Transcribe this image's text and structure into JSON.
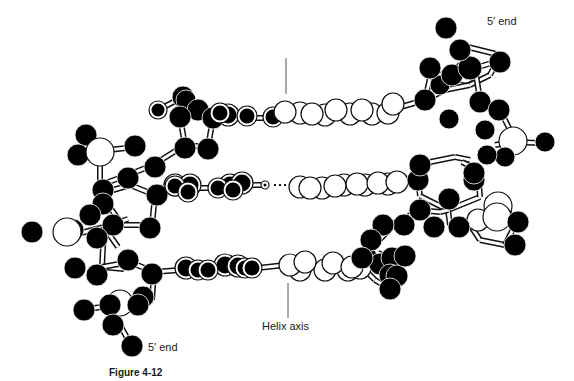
{
  "figure": {
    "caption": "Figure 4-12",
    "labels": {
      "five_prime_top": "5′ end",
      "five_prime_bottom": "5′ end",
      "helix_axis": "Helix axis"
    },
    "colors": {
      "dark_atom": "#000000",
      "light_atom": "#ffffff",
      "stroke": "#111111",
      "axis_line": "#555555"
    },
    "helix_axis_lines": [
      {
        "x1": 286,
        "y1": 58,
        "x2": 286,
        "y2": 94
      },
      {
        "x1": 288,
        "y1": 283,
        "x2": 288,
        "y2": 318
      }
    ],
    "hbond": {
      "x1": 274,
      "y1": 185,
      "x2": 290,
      "y2": 185
    },
    "bonds": [
      [
        158,
        110,
        183,
        97
      ],
      [
        183,
        97,
        189,
        100
      ],
      [
        183,
        97,
        180,
        117
      ],
      [
        180,
        117,
        185,
        145
      ],
      [
        185,
        145,
        208,
        147
      ],
      [
        208,
        147,
        213,
        118
      ],
      [
        213,
        118,
        198,
        110
      ],
      [
        213,
        118,
        235,
        118
      ],
      [
        235,
        118,
        260,
        118
      ],
      [
        260,
        118,
        275,
        118
      ],
      [
        275,
        118,
        285,
        115
      ],
      [
        285,
        115,
        300,
        115
      ],
      [
        300,
        115,
        325,
        113
      ],
      [
        325,
        113,
        350,
        112
      ],
      [
        350,
        112,
        372,
        112
      ],
      [
        372,
        112,
        390,
        110
      ],
      [
        390,
        110,
        425,
        100
      ],
      [
        425,
        100,
        445,
        90
      ],
      [
        445,
        90,
        470,
        85
      ],
      [
        470,
        85,
        490,
        75
      ],
      [
        490,
        75,
        500,
        55
      ],
      [
        500,
        55,
        460,
        45
      ],
      [
        425,
        100,
        430,
        78
      ],
      [
        430,
        78,
        455,
        70
      ],
      [
        455,
        70,
        465,
        68
      ],
      [
        475,
        68,
        495,
        62
      ],
      [
        475,
        68,
        480,
        100
      ],
      [
        480,
        100,
        500,
        110
      ],
      [
        500,
        110,
        510,
        130
      ],
      [
        510,
        130,
        512,
        142
      ],
      [
        512,
        142,
        540,
        143
      ],
      [
        512,
        142,
        495,
        145
      ],
      [
        512,
        142,
        505,
        155
      ],
      [
        100,
        151,
        135,
        147
      ],
      [
        100,
        151,
        86,
        135
      ],
      [
        100,
        151,
        78,
        158
      ],
      [
        100,
        151,
        100,
        185
      ],
      [
        100,
        185,
        128,
        175
      ],
      [
        128,
        175,
        153,
        165
      ],
      [
        153,
        165,
        185,
        145
      ],
      [
        100,
        185,
        103,
        193
      ],
      [
        103,
        193,
        130,
        185
      ],
      [
        130,
        185,
        155,
        195
      ],
      [
        155,
        195,
        152,
        225
      ],
      [
        152,
        225,
        122,
        225
      ],
      [
        122,
        225,
        105,
        200
      ],
      [
        105,
        200,
        103,
        193
      ],
      [
        155,
        195,
        172,
        188
      ],
      [
        172,
        188,
        215,
        188
      ],
      [
        215,
        188,
        255,
        185
      ],
      [
        255,
        185,
        268,
        185
      ],
      [
        290,
        185,
        320,
        185
      ],
      [
        320,
        185,
        345,
        183
      ],
      [
        345,
        183,
        380,
        182
      ],
      [
        380,
        182,
        418,
        180
      ],
      [
        418,
        180,
        430,
        162
      ],
      [
        430,
        162,
        455,
        157
      ],
      [
        455,
        157,
        470,
        160
      ],
      [
        418,
        180,
        420,
        196
      ],
      [
        420,
        196,
        448,
        210
      ],
      [
        448,
        210,
        480,
        197
      ],
      [
        480,
        197,
        478,
        170
      ],
      [
        478,
        170,
        462,
        162
      ],
      [
        448,
        210,
        450,
        225
      ],
      [
        450,
        225,
        470,
        225
      ],
      [
        470,
        225,
        480,
        240
      ],
      [
        480,
        240,
        505,
        245
      ],
      [
        505,
        245,
        515,
        225
      ],
      [
        515,
        225,
        505,
        205
      ],
      [
        505,
        205,
        485,
        200
      ],
      [
        448,
        210,
        440,
        212
      ],
      [
        440,
        212,
        418,
        210
      ],
      [
        418,
        210,
        400,
        222
      ],
      [
        400,
        222,
        378,
        225
      ],
      [
        378,
        225,
        370,
        240
      ],
      [
        73,
        235,
        104,
        227
      ],
      [
        104,
        227,
        128,
        219
      ],
      [
        104,
        227,
        102,
        267
      ],
      [
        102,
        267,
        124,
        269
      ],
      [
        104,
        227,
        118,
        247
      ],
      [
        102,
        267,
        130,
        262
      ],
      [
        130,
        262,
        154,
        272
      ],
      [
        154,
        272,
        152,
        300
      ],
      [
        152,
        300,
        125,
        308
      ],
      [
        125,
        308,
        112,
        300
      ],
      [
        154,
        272,
        180,
        270
      ],
      [
        180,
        270,
        215,
        270
      ],
      [
        215,
        270,
        258,
        268
      ],
      [
        258,
        268,
        285,
        265
      ],
      [
        285,
        265,
        320,
        265
      ],
      [
        320,
        265,
        340,
        265
      ],
      [
        340,
        265,
        360,
        265
      ],
      [
        360,
        265,
        366,
        255
      ],
      [
        366,
        255,
        394,
        224
      ],
      [
        394,
        224,
        400,
        225
      ],
      [
        360,
        265,
        375,
        280
      ],
      [
        375,
        280,
        388,
        288
      ],
      [
        388,
        288,
        395,
        260
      ],
      [
        395,
        260,
        378,
        253
      ],
      [
        113,
        305,
        120,
        325
      ],
      [
        120,
        325,
        131,
        345
      ],
      [
        113,
        305,
        83,
        310
      ],
      [
        113,
        305,
        130,
        300
      ]
    ],
    "atoms_back": [
      {
        "x": 183,
        "y": 97,
        "r": 11,
        "fill": "dark"
      },
      {
        "x": 300,
        "y": 113,
        "r": 11,
        "fill": "light"
      },
      {
        "x": 325,
        "y": 115,
        "r": 11,
        "fill": "light"
      },
      {
        "x": 350,
        "y": 114,
        "r": 11,
        "fill": "light"
      },
      {
        "x": 372,
        "y": 114,
        "r": 11,
        "fill": "light"
      },
      {
        "x": 388,
        "y": 113,
        "r": 11,
        "fill": "light"
      },
      {
        "x": 300,
        "y": 187,
        "r": 11,
        "fill": "light"
      },
      {
        "x": 322,
        "y": 188,
        "r": 11,
        "fill": "light"
      },
      {
        "x": 344,
        "y": 185,
        "r": 11,
        "fill": "light"
      },
      {
        "x": 365,
        "y": 185,
        "r": 11,
        "fill": "light"
      },
      {
        "x": 388,
        "y": 184,
        "r": 11,
        "fill": "light"
      },
      {
        "x": 300,
        "y": 270,
        "r": 11,
        "fill": "light"
      },
      {
        "x": 325,
        "y": 270,
        "r": 11,
        "fill": "light"
      },
      {
        "x": 348,
        "y": 270,
        "r": 11,
        "fill": "light"
      },
      {
        "x": 360,
        "y": 268,
        "r": 11,
        "fill": "light"
      },
      {
        "x": 228,
        "y": 115,
        "r": 11,
        "fill": "darkring"
      },
      {
        "x": 175,
        "y": 185,
        "r": 11,
        "fill": "darkring"
      },
      {
        "x": 190,
        "y": 185,
        "r": 11,
        "fill": "darkring"
      },
      {
        "x": 230,
        "y": 185,
        "r": 11,
        "fill": "darkring"
      },
      {
        "x": 242,
        "y": 183,
        "r": 11,
        "fill": "darkring"
      },
      {
        "x": 186,
        "y": 268,
        "r": 11,
        "fill": "darkring"
      },
      {
        "x": 225,
        "y": 265,
        "r": 11,
        "fill": "darkring"
      },
      {
        "x": 238,
        "y": 266,
        "r": 11,
        "fill": "darkring"
      }
    ],
    "atoms": [
      {
        "x": 158,
        "y": 110,
        "r": 9,
        "fill": "darkring"
      },
      {
        "x": 186,
        "y": 100,
        "r": 10,
        "fill": "dark"
      },
      {
        "x": 198,
        "y": 110,
        "r": 11,
        "fill": "dark"
      },
      {
        "x": 180,
        "y": 117,
        "r": 11,
        "fill": "dark"
      },
      {
        "x": 213,
        "y": 118,
        "r": 11,
        "fill": "dark"
      },
      {
        "x": 185,
        "y": 148,
        "r": 11,
        "fill": "dark"
      },
      {
        "x": 208,
        "y": 149,
        "r": 11,
        "fill": "dark"
      },
      {
        "x": 220,
        "y": 113,
        "r": 10,
        "fill": "darkring"
      },
      {
        "x": 247,
        "y": 116,
        "r": 10,
        "fill": "darkring"
      },
      {
        "x": 273,
        "y": 117,
        "r": 10,
        "fill": "darkring"
      },
      {
        "x": 285,
        "y": 112,
        "r": 11,
        "fill": "light"
      },
      {
        "x": 312,
        "y": 114,
        "r": 11,
        "fill": "light"
      },
      {
        "x": 336,
        "y": 110,
        "r": 11,
        "fill": "light"
      },
      {
        "x": 362,
        "y": 110,
        "r": 11,
        "fill": "light"
      },
      {
        "x": 393,
        "y": 104,
        "r": 11,
        "fill": "light"
      },
      {
        "x": 425,
        "y": 100,
        "r": 11,
        "fill": "dark"
      },
      {
        "x": 449,
        "y": 119,
        "r": 10,
        "fill": "dark"
      },
      {
        "x": 480,
        "y": 102,
        "r": 11,
        "fill": "dark"
      },
      {
        "x": 440,
        "y": 85,
        "r": 10,
        "fill": "dark"
      },
      {
        "x": 430,
        "y": 68,
        "r": 11,
        "fill": "dark"
      },
      {
        "x": 465,
        "y": 72,
        "r": 11,
        "fill": "light"
      },
      {
        "x": 452,
        "y": 75,
        "r": 11,
        "fill": "dark"
      },
      {
        "x": 470,
        "y": 68,
        "r": 12,
        "fill": "dark"
      },
      {
        "x": 460,
        "y": 50,
        "r": 11,
        "fill": "dark"
      },
      {
        "x": 500,
        "y": 62,
        "r": 11,
        "fill": "dark"
      },
      {
        "x": 446,
        "y": 28,
        "r": 11,
        "fill": "dark"
      },
      {
        "x": 499,
        "y": 110,
        "r": 11,
        "fill": "dark"
      },
      {
        "x": 513,
        "y": 141,
        "r": 14,
        "fill": "light"
      },
      {
        "x": 545,
        "y": 142,
        "r": 10,
        "fill": "dark"
      },
      {
        "x": 505,
        "y": 157,
        "r": 10,
        "fill": "dark"
      },
      {
        "x": 485,
        "y": 130,
        "r": 10,
        "fill": "dark"
      },
      {
        "x": 487,
        "y": 155,
        "r": 10,
        "fill": "dark"
      },
      {
        "x": 86,
        "y": 135,
        "r": 11,
        "fill": "dark"
      },
      {
        "x": 78,
        "y": 155,
        "r": 11,
        "fill": "dark"
      },
      {
        "x": 100,
        "y": 152,
        "r": 14,
        "fill": "light"
      },
      {
        "x": 135,
        "y": 146,
        "r": 11,
        "fill": "dark"
      },
      {
        "x": 155,
        "y": 167,
        "r": 11,
        "fill": "dark"
      },
      {
        "x": 103,
        "y": 190,
        "r": 11,
        "fill": "dark"
      },
      {
        "x": 128,
        "y": 178,
        "r": 11,
        "fill": "dark"
      },
      {
        "x": 103,
        "y": 204,
        "r": 11,
        "fill": "dark"
      },
      {
        "x": 157,
        "y": 195,
        "r": 11,
        "fill": "dark"
      },
      {
        "x": 113,
        "y": 225,
        "r": 11,
        "fill": "dark"
      },
      {
        "x": 150,
        "y": 228,
        "r": 11,
        "fill": "dark"
      },
      {
        "x": 175,
        "y": 186,
        "r": 10,
        "fill": "darkring"
      },
      {
        "x": 188,
        "y": 192,
        "r": 10,
        "fill": "darkring"
      },
      {
        "x": 218,
        "y": 188,
        "r": 10,
        "fill": "darkring"
      },
      {
        "x": 233,
        "y": 190,
        "r": 10,
        "fill": "darkring"
      },
      {
        "x": 265,
        "y": 185,
        "r": 4,
        "fill": "darkring"
      },
      {
        "x": 310,
        "y": 188,
        "r": 11,
        "fill": "light"
      },
      {
        "x": 335,
        "y": 186,
        "r": 11,
        "fill": "light"
      },
      {
        "x": 357,
        "y": 184,
        "r": 11,
        "fill": "light"
      },
      {
        "x": 378,
        "y": 183,
        "r": 11,
        "fill": "light"
      },
      {
        "x": 397,
        "y": 182,
        "r": 11,
        "fill": "light"
      },
      {
        "x": 418,
        "y": 180,
        "r": 11,
        "fill": "dark"
      },
      {
        "x": 449,
        "y": 199,
        "r": 11,
        "fill": "dark"
      },
      {
        "x": 474,
        "y": 180,
        "r": 11,
        "fill": "dark"
      },
      {
        "x": 474,
        "y": 173,
        "r": 11,
        "fill": "dark"
      },
      {
        "x": 434,
        "y": 227,
        "r": 11,
        "fill": "dark"
      },
      {
        "x": 420,
        "y": 210,
        "r": 11,
        "fill": "dark"
      },
      {
        "x": 478,
        "y": 220,
        "r": 11,
        "fill": "light"
      },
      {
        "x": 498,
        "y": 206,
        "r": 14,
        "fill": "light"
      },
      {
        "x": 497,
        "y": 217,
        "r": 14,
        "fill": "light"
      },
      {
        "x": 420,
        "y": 165,
        "r": 11,
        "fill": "dark"
      },
      {
        "x": 459,
        "y": 227,
        "r": 11,
        "fill": "dark"
      },
      {
        "x": 518,
        "y": 222,
        "r": 11,
        "fill": "dark"
      },
      {
        "x": 515,
        "y": 245,
        "r": 11,
        "fill": "dark"
      },
      {
        "x": 404,
        "y": 225,
        "r": 11,
        "fill": "dark"
      },
      {
        "x": 383,
        "y": 225,
        "r": 11,
        "fill": "dark"
      },
      {
        "x": 366,
        "y": 257,
        "r": 11,
        "fill": "dark"
      },
      {
        "x": 371,
        "y": 240,
        "r": 11,
        "fill": "dark"
      },
      {
        "x": 380,
        "y": 264,
        "r": 11,
        "fill": "dark"
      },
      {
        "x": 392,
        "y": 258,
        "r": 11,
        "fill": "dark"
      },
      {
        "x": 390,
        "y": 275,
        "r": 11,
        "fill": "dark"
      },
      {
        "x": 397,
        "y": 276,
        "r": 11,
        "fill": "dark"
      },
      {
        "x": 405,
        "y": 256,
        "r": 11,
        "fill": "dark"
      },
      {
        "x": 390,
        "y": 289,
        "r": 11,
        "fill": "dark"
      },
      {
        "x": 32,
        "y": 232,
        "r": 11,
        "fill": "dark"
      },
      {
        "x": 73,
        "y": 230,
        "r": 11,
        "fill": "dark"
      },
      {
        "x": 67,
        "y": 232,
        "r": 14,
        "fill": "light"
      },
      {
        "x": 90,
        "y": 215,
        "r": 11,
        "fill": "dark"
      },
      {
        "x": 97,
        "y": 238,
        "r": 11,
        "fill": "dark"
      },
      {
        "x": 75,
        "y": 268,
        "r": 11,
        "fill": "dark"
      },
      {
        "x": 97,
        "y": 275,
        "r": 11,
        "fill": "dark"
      },
      {
        "x": 128,
        "y": 260,
        "r": 11,
        "fill": "dark"
      },
      {
        "x": 152,
        "y": 274,
        "r": 11,
        "fill": "dark"
      },
      {
        "x": 143,
        "y": 297,
        "r": 11,
        "fill": "dark"
      },
      {
        "x": 84,
        "y": 310,
        "r": 11,
        "fill": "dark"
      },
      {
        "x": 120,
        "y": 303,
        "r": 13,
        "fill": "light"
      },
      {
        "x": 110,
        "y": 305,
        "r": 11,
        "fill": "dark"
      },
      {
        "x": 138,
        "y": 305,
        "r": 11,
        "fill": "dark"
      },
      {
        "x": 113,
        "y": 325,
        "r": 11,
        "fill": "dark"
      },
      {
        "x": 132,
        "y": 346,
        "r": 11,
        "fill": "dark"
      },
      {
        "x": 198,
        "y": 270,
        "r": 10,
        "fill": "darkring"
      },
      {
        "x": 208,
        "y": 270,
        "r": 10,
        "fill": "darkring"
      },
      {
        "x": 245,
        "y": 268,
        "r": 10,
        "fill": "darkring"
      },
      {
        "x": 252,
        "y": 268,
        "r": 10,
        "fill": "darkring"
      },
      {
        "x": 290,
        "y": 265,
        "r": 11,
        "fill": "light"
      },
      {
        "x": 305,
        "y": 262,
        "r": 11,
        "fill": "light"
      },
      {
        "x": 333,
        "y": 263,
        "r": 11,
        "fill": "light"
      },
      {
        "x": 352,
        "y": 267,
        "r": 11,
        "fill": "light"
      },
      {
        "x": 362,
        "y": 258,
        "r": 11,
        "fill": "dark"
      }
    ]
  }
}
